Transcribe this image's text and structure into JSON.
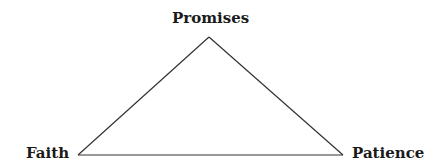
{
  "diagram": {
    "type": "triangle",
    "vertices": {
      "top": {
        "label": "Promises"
      },
      "left": {
        "label": "Faith"
      },
      "right": {
        "label": "Patience"
      }
    },
    "line_color": "#333333"
  }
}
